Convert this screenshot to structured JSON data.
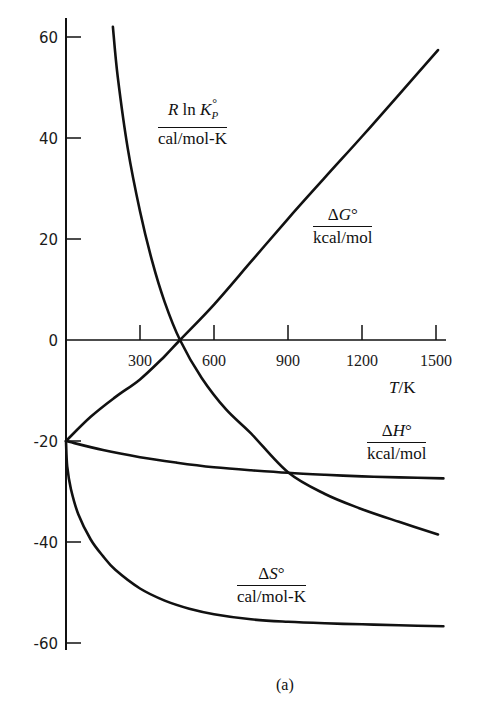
{
  "chart_data": {
    "type": "line",
    "title": "",
    "caption": "(a)",
    "xlabel": "T/K",
    "ylabel": "",
    "xlim": [
      0,
      1530
    ],
    "ylim": [
      -62,
      64
    ],
    "x_ticks": [
      300,
      600,
      900,
      1200,
      1500
    ],
    "y_ticks": [
      60,
      40,
      20,
      0,
      -20,
      -40,
      -60
    ],
    "grid": false,
    "legend": "inline labels",
    "series": [
      {
        "name": "ΔG°/kcal/mol",
        "label_num": "ΔG°",
        "label_den": "kcal/mol",
        "x": [
          0,
          100,
          200,
          300,
          400,
          462,
          600,
          750,
          900,
          1050,
          1200,
          1350,
          1508
        ],
        "y": [
          -20,
          -15.2,
          -11.3,
          -7.8,
          -3.2,
          0,
          7.0,
          15.5,
          24.0,
          32.2,
          40.3,
          48.6,
          57.4
        ]
      },
      {
        "name": "R ln Kp°/cal/mol-K",
        "label_num": "R ln K",
        "label_sub": "P",
        "label_den": "cal/mol-K",
        "x": [
          190,
          210,
          250,
          300,
          350,
          400,
          462,
          550,
          650,
          750,
          900,
          1050,
          1200,
          1350,
          1508
        ],
        "y": [
          62,
          52,
          38,
          25.5,
          15.5,
          7.5,
          0,
          -7.5,
          -13.8,
          -18.5,
          -26.2,
          -30.5,
          -33.5,
          -36,
          -38.5
        ]
      },
      {
        "name": "ΔH°/kcal/mol",
        "label_num": "ΔH°",
        "label_den": "kcal/mol",
        "x": [
          0,
          150,
          300,
          450,
          600,
          750,
          900,
          1050,
          1200,
          1350,
          1530
        ],
        "y": [
          -20,
          -21.8,
          -23.2,
          -24.3,
          -25.2,
          -25.8,
          -26.3,
          -26.7,
          -27.0,
          -27.2,
          -27.4
        ]
      },
      {
        "name": "ΔS°/cal/mol-K",
        "label_num": "ΔS°",
        "label_den": "cal/mol-K",
        "x": [
          0,
          5,
          20,
          50,
          100,
          150,
          200,
          300,
          400,
          500,
          600,
          750,
          900,
          1050,
          1200,
          1350,
          1530
        ],
        "y": [
          -20,
          -25,
          -29.5,
          -34.5,
          -39.5,
          -42.8,
          -45.5,
          -49.2,
          -51.6,
          -53.2,
          -54.3,
          -55.3,
          -55.8,
          -56.1,
          -56.3,
          -56.5,
          -56.7
        ]
      }
    ]
  }
}
